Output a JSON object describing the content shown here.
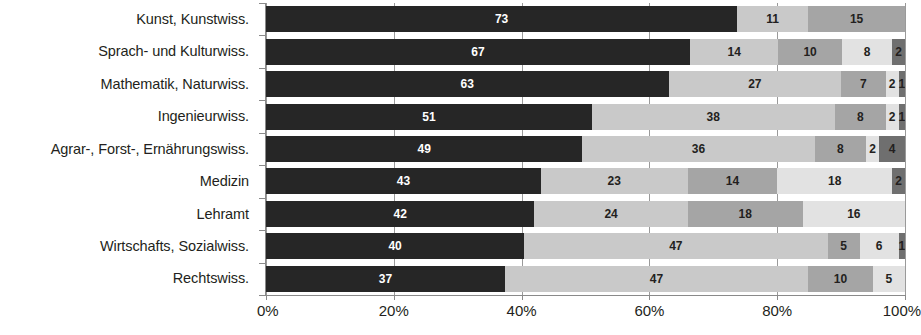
{
  "chart_data": {
    "type": "bar",
    "orientation": "horizontal",
    "stacked": true,
    "stack_mode": "percent",
    "title": "",
    "xlabel": "",
    "ylabel": "",
    "xlim": [
      0,
      100
    ],
    "xticks": [
      "0%",
      "20%",
      "40%",
      "60%",
      "80%",
      "100%"
    ],
    "xtick_values": [
      0,
      20,
      40,
      60,
      80,
      100
    ],
    "grid": true,
    "legend": "none",
    "categories": [
      "Kunst, Kunstwiss.",
      "Sprach- und Kulturwiss.",
      "Mathematik, Naturwiss.",
      "Ingenieurwiss.",
      "Agrar-, Forst-, Ernährungswiss.",
      "Medizin",
      "Lehramt",
      "Wirtschafts, Sozialwiss.",
      "Rechtswiss."
    ],
    "series": [
      {
        "name": "Segment 1",
        "color": "#262626",
        "values": [
          73,
          67,
          63,
          51,
          49,
          43,
          42,
          40,
          37
        ]
      },
      {
        "name": "Segment 2",
        "color": "#c9c9c9",
        "values": [
          11,
          14,
          27,
          38,
          36,
          23,
          24,
          47,
          47
        ]
      },
      {
        "name": "Segment 3",
        "color": "#a5a5a5",
        "values": [
          15,
          10,
          7,
          8,
          8,
          14,
          18,
          5,
          10
        ]
      },
      {
        "name": "Segment 4",
        "color": "#e2e2e2",
        "values": [
          0,
          8,
          2,
          2,
          2,
          18,
          16,
          6,
          5
        ]
      },
      {
        "name": "Segment 5",
        "color": "#6f6f6f",
        "values": [
          0,
          2,
          1,
          1,
          4,
          2,
          0,
          1,
          0
        ]
      }
    ],
    "rows": [
      {
        "category": "Kunst, Kunstwiss.",
        "values": [
          73,
          11,
          15,
          0,
          0
        ]
      },
      {
        "category": "Sprach- und Kulturwiss.",
        "values": [
          67,
          14,
          10,
          8,
          2
        ]
      },
      {
        "category": "Mathematik, Naturwiss.",
        "values": [
          63,
          27,
          7,
          2,
          1
        ]
      },
      {
        "category": "Ingenieurwiss.",
        "values": [
          51,
          38,
          8,
          2,
          1
        ]
      },
      {
        "category": "Agrar-, Forst-, Ernährungswiss.",
        "values": [
          49,
          36,
          8,
          2,
          4
        ]
      },
      {
        "category": "Medizin",
        "values": [
          43,
          23,
          14,
          18,
          2
        ]
      },
      {
        "category": "Lehramt",
        "values": [
          42,
          24,
          18,
          16,
          0
        ]
      },
      {
        "category": "Wirtschafts, Sozialwiss.",
        "values": [
          40,
          47,
          5,
          6,
          1
        ]
      },
      {
        "category": "Rechtswiss.",
        "values": [
          37,
          47,
          10,
          5,
          0
        ]
      }
    ],
    "colors": {
      "segment_1": "#262626",
      "segment_2": "#c9c9c9",
      "segment_3": "#a5a5a5",
      "segment_4": "#e2e2e2",
      "segment_5": "#6f6f6f",
      "axis": "#8a8a8a",
      "text": "#231f20",
      "background": "#ffffff"
    }
  }
}
